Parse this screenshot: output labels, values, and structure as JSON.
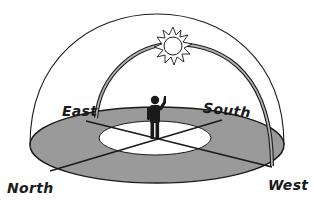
{
  "diagram": {
    "type": "celestial-dome-sun-path",
    "colors": {
      "ground": "#9a9a9a",
      "inner_circle": "#ffffff",
      "lines": "#1a1a1a",
      "sun_path_fill": "#a8a8a8",
      "person": "#1a1a1a"
    },
    "labels": {
      "east": "East",
      "south": "South",
      "north": "North",
      "west": "West"
    }
  }
}
